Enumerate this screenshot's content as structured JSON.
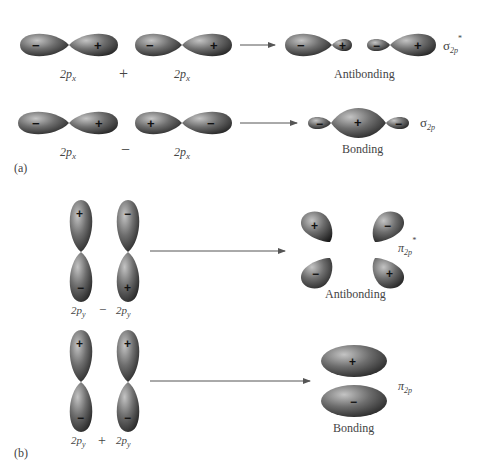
{
  "colors": {
    "lobe_light": "#b8b8b8",
    "lobe_mid": "#6e6e6e",
    "lobe_dark": "#1c1c1c",
    "arrow": "#555555",
    "text": "#444444"
  },
  "panel_a": {
    "label": "(a)",
    "rows": [
      {
        "id": "antibonding-sigma",
        "orbital1": {
          "name": "2p",
          "sub": "x",
          "left_sign": "−",
          "right_sign": "+"
        },
        "operator": "+",
        "orbital2": {
          "name": "2p",
          "sub": "x",
          "left_sign": "−",
          "right_sign": "+"
        },
        "result_signs": [
          "−",
          "+",
          "−",
          "+"
        ],
        "result_label": "Antibonding",
        "mo_symbol": "σ",
        "mo_sub": "2p",
        "mo_sup": "*"
      },
      {
        "id": "bonding-sigma",
        "orbital1": {
          "name": "2p",
          "sub": "x",
          "left_sign": "−",
          "right_sign": "+"
        },
        "operator": "−",
        "orbital2": {
          "name": "2p",
          "sub": "x",
          "left_sign": "+",
          "right_sign": "−"
        },
        "result_signs": [
          "−",
          "+",
          "−"
        ],
        "result_label": "Bonding",
        "mo_symbol": "σ",
        "mo_sub": "2p",
        "mo_sup": ""
      }
    ]
  },
  "panel_b": {
    "label": "(b)",
    "rows": [
      {
        "id": "antibonding-pi",
        "orbital1": {
          "name": "2p",
          "sub": "y",
          "top_sign": "+",
          "bottom_sign": "−"
        },
        "operator": "−",
        "orbital2": {
          "name": "2p",
          "sub": "y",
          "top_sign": "−",
          "bottom_sign": "+"
        },
        "result_signs": [
          "+",
          "−",
          "−",
          "+"
        ],
        "result_label": "Antibonding",
        "mo_symbol": "π",
        "mo_sub": "2p",
        "mo_sup": "*"
      },
      {
        "id": "bonding-pi",
        "orbital1": {
          "name": "2p",
          "sub": "y",
          "top_sign": "+",
          "bottom_sign": "−"
        },
        "operator": "+",
        "orbital2": {
          "name": "2p",
          "sub": "y",
          "top_sign": "+",
          "bottom_sign": "−"
        },
        "result_signs": [
          "+",
          "−"
        ],
        "result_label": "Bonding",
        "mo_symbol": "π",
        "mo_sub": "2p",
        "mo_sup": ""
      }
    ]
  }
}
